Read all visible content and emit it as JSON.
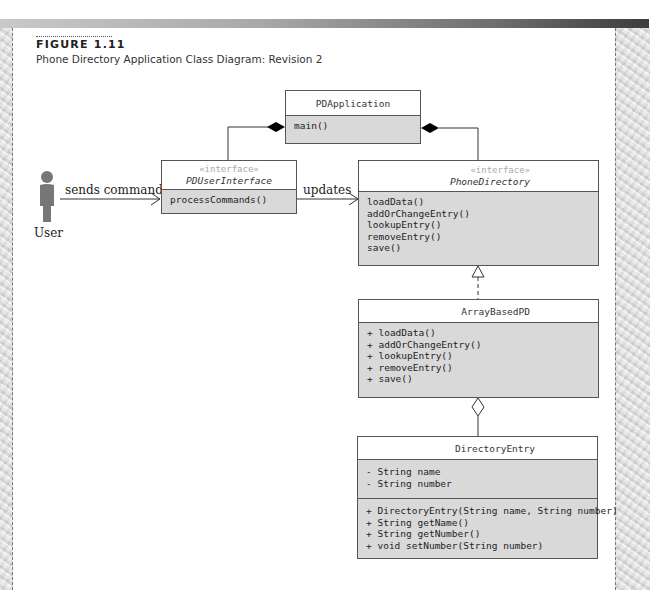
{
  "figure": {
    "label": "FIGURE 1.11",
    "caption": "Phone Directory Application Class Diagram: Revision 2"
  },
  "actor": {
    "icon": "user-icon",
    "label": "User"
  },
  "associations": {
    "sends_command": "sends command",
    "updates": "updates"
  },
  "classes": {
    "pdapplication": {
      "name": "PDApplication",
      "methods": [
        "main()"
      ]
    },
    "pduserinterface": {
      "stereotype": "«interface»",
      "name": "PDUserInterface",
      "methods": [
        "processCommands()"
      ]
    },
    "phonedirectory": {
      "stereotype": "«interface»",
      "name": "PhoneDirectory",
      "methods": [
        "loadData()",
        "addOrChangeEntry()",
        "lookupEntry()",
        "removeEntry()",
        "save()"
      ]
    },
    "arraybasedpd": {
      "name": "ArrayBasedPD",
      "methods": [
        "+ loadData()",
        "+ addOrChangeEntry()",
        "+ lookupEntry()",
        "+ removeEntry()",
        "+ save()"
      ]
    },
    "directoryentry": {
      "name": "DirectoryEntry",
      "attributes": [
        "- String name",
        "- String number"
      ],
      "methods": [
        "+ DirectoryEntry(String name, String number)",
        "+ String getName()",
        "+ String getNumber()",
        "+ void setNumber(String number)"
      ]
    }
  },
  "relationships": [
    {
      "type": "composition",
      "from": "PDApplication",
      "to": "PDUserInterface"
    },
    {
      "type": "composition",
      "from": "PDApplication",
      "to": "PhoneDirectory"
    },
    {
      "type": "association",
      "from": "User",
      "to": "PDUserInterface",
      "label": "sends command"
    },
    {
      "type": "association",
      "from": "PDUserInterface",
      "to": "PhoneDirectory",
      "label": "updates"
    },
    {
      "type": "realization",
      "from": "ArrayBasedPD",
      "to": "PhoneDirectory"
    },
    {
      "type": "aggregation",
      "from": "ArrayBasedPD",
      "to": "DirectoryEntry"
    }
  ],
  "colors": {
    "compartment_fill": "#d9d9d9",
    "stereotype_text": "#a9a9a9",
    "border": "#555555"
  }
}
